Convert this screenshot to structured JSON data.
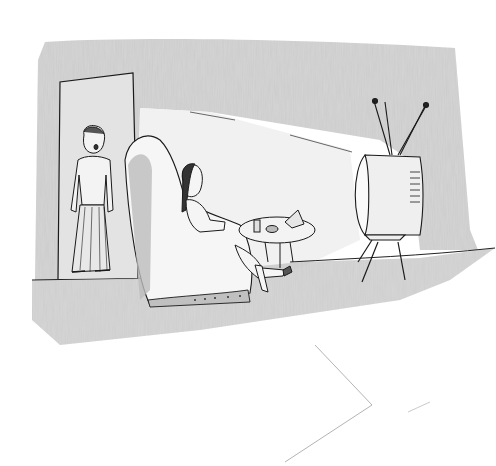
{
  "image": {
    "kind": "pencil-sketch-cartoon",
    "caption": "",
    "scene": "living room",
    "elements": [
      "doorway",
      "standing-woman",
      "armchair",
      "seated-woman",
      "side-table",
      "snacks",
      "television",
      "antennas",
      "floor",
      "back-wall"
    ]
  },
  "colors": {
    "background": "#ffffff",
    "wall_shading": "#bdbdbd",
    "floor_shading": "#c8c8c8",
    "line": "#1a1a1a",
    "light_fill": "#f4f4f4"
  }
}
